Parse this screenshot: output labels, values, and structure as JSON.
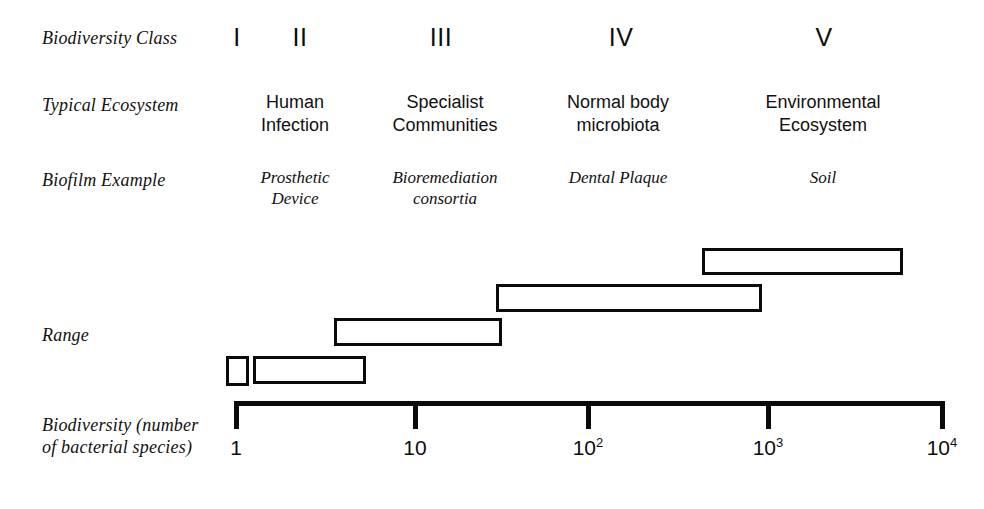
{
  "figure": {
    "background": "#ffffff",
    "ink": "#0a0a0a"
  },
  "row_labels": {
    "class": "Biodiversity Class",
    "ecosystem": "Typical  Ecosystem",
    "biofilm": "Biofilm Example",
    "range": "Range",
    "axis": "Biodiversity (number\nof bacterial species)"
  },
  "classes": [
    {
      "numeral": "I",
      "ecosystem": "",
      "biofilm": "",
      "numeral_x": 237,
      "column_x": 237
    },
    {
      "numeral": "II",
      "ecosystem": "Human\nInfection",
      "biofilm": "Prosthetic\nDevice",
      "numeral_x": 300,
      "column_x": 295
    },
    {
      "numeral": "III",
      "ecosystem": "Specialist\nCommunities",
      "biofilm": "Bioremediation\nconsortia",
      "numeral_x": 441,
      "column_x": 445
    },
    {
      "numeral": "IV",
      "ecosystem": "Normal body\nmicrobiota",
      "biofilm": "Dental Plaque",
      "numeral_x": 621,
      "column_x": 618
    },
    {
      "numeral": "V",
      "ecosystem": "Environmental\nEcosystem",
      "biofilm": "Soil",
      "numeral_x": 824,
      "column_x": 823
    }
  ],
  "chart_data": {
    "type": "bar",
    "xlabel": "Biodiversity (number of bacterial species)",
    "ylabel": "Range",
    "orientation": "horizontal-ranges",
    "x_scale": "log10",
    "xlim": [
      1,
      10000
    ],
    "grid": false,
    "legend": null,
    "axis_ticks": [
      {
        "label": "1",
        "value": 1,
        "x": 236
      },
      {
        "label": "10",
        "value": 10,
        "x": 415
      },
      {
        "label": "10^2",
        "value": 100,
        "x": 588
      },
      {
        "label": "10^3",
        "value": 1000,
        "x": 768
      },
      {
        "label": "10^4",
        "value": 10000,
        "x": 942
      }
    ],
    "tick_labels_display": [
      "1",
      "10",
      "10²",
      "10³",
      "10⁴"
    ],
    "categories": [
      "I",
      "II",
      "III",
      "IV",
      "V"
    ],
    "ranges": [
      {
        "class": "I",
        "species_min": 1,
        "species_max": 1.3,
        "px": {
          "x": 226,
          "y": 356,
          "w": 23,
          "h": 30
        }
      },
      {
        "class": "II",
        "species_min": 1.5,
        "species_max": 6,
        "px": {
          "x": 253,
          "y": 356,
          "w": 113,
          "h": 28
        }
      },
      {
        "class": "III",
        "species_min": 4,
        "species_max": 35,
        "px": {
          "x": 334,
          "y": 318,
          "w": 168,
          "h": 28
        }
      },
      {
        "class": "IV",
        "species_min": 30,
        "species_max": 900,
        "px": {
          "x": 496,
          "y": 284,
          "w": 266,
          "h": 28
        }
      },
      {
        "class": "V",
        "species_min": 600,
        "species_max": 5800,
        "px": {
          "x": 702,
          "y": 248,
          "w": 201,
          "h": 27
        }
      }
    ]
  },
  "layout": {
    "row_label_x": 42,
    "row_y": {
      "class": 28,
      "ecosystem": 95,
      "biofilm": 170,
      "range": 325,
      "axis": 415
    },
    "numeral_y": 23,
    "ecosystem_y": 91,
    "biofilm_y": 167,
    "axis_line": {
      "x": 236,
      "y": 401,
      "w": 707,
      "h": 5
    },
    "tick_height": 28,
    "tick_width": 5,
    "tick_label_y": 436
  }
}
